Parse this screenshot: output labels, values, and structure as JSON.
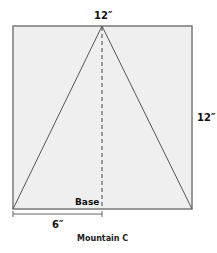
{
  "figure": {
    "caption": "Mountain C",
    "labels": {
      "top_width": "12″",
      "right_height": "12″",
      "base": "Base",
      "half_base": "6″"
    },
    "colors": {
      "square_fill": "#efefef",
      "square_stroke": "#7a7a7a",
      "triangle_stroke": "#555555",
      "dash_stroke": "#444444",
      "dimension_stroke": "#666666"
    }
  }
}
